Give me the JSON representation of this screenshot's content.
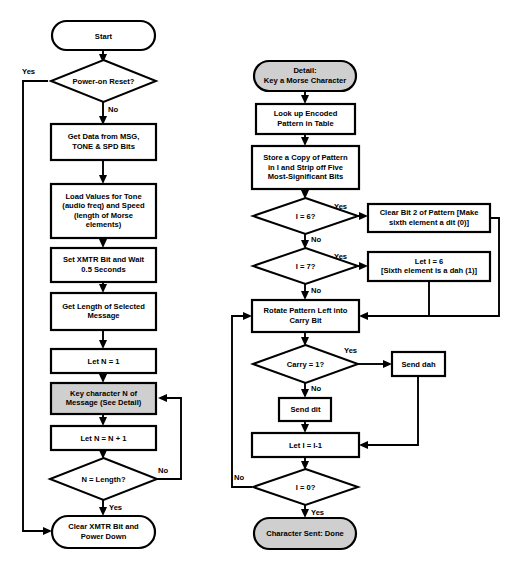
{
  "diagram": {
    "colors": {
      "line": "#000000",
      "node_fill": "#ffffff",
      "shaded_fill": "#cfcfcf",
      "background": "#ffffff"
    },
    "main_flow": {
      "nodes": [
        {
          "id": "start",
          "type": "terminal",
          "label": "Start"
        },
        {
          "id": "power_on_reset",
          "type": "decision",
          "label": "Power-on Reset?"
        },
        {
          "id": "get_data",
          "type": "process",
          "label": "Get Data from MSG,\nTONE & SPD Bits"
        },
        {
          "id": "load_values",
          "type": "process",
          "label": "Load Values for Tone\n(audio freq) and Speed\n(length of Morse\nelements)"
        },
        {
          "id": "set_xmtr",
          "type": "process",
          "label": "Set XMTR Bit and Wait\n0.5 Seconds"
        },
        {
          "id": "get_length",
          "type": "process",
          "label": "Get Length of Selected\nMessage"
        },
        {
          "id": "let_n_1",
          "type": "process",
          "label": "Let N = 1"
        },
        {
          "id": "key_char",
          "type": "process-shaded",
          "label": "Key character N of\nMessage (See Detail)"
        },
        {
          "id": "let_n_inc",
          "type": "process",
          "label": "Let N = N + 1"
        },
        {
          "id": "n_eq_length",
          "type": "decision",
          "label": "N = Length?"
        },
        {
          "id": "clear_xmtr",
          "type": "terminal",
          "label": "Clear XMTR Bit and\nPower Down"
        }
      ],
      "edge_labels": {
        "power_on_reset_yes": "Yes",
        "power_on_reset_no": "No",
        "n_eq_length_no": "No",
        "n_eq_length_yes": "Yes"
      }
    },
    "detail_flow": {
      "nodes": [
        {
          "id": "detail_start",
          "type": "terminal-shaded",
          "label": "Detail:\nKey a Morse Character"
        },
        {
          "id": "lookup",
          "type": "process",
          "label": "Look up Encoded\nPattern in Table"
        },
        {
          "id": "store_copy",
          "type": "process",
          "label": "Store a Copy of Pattern\nin I and Strip off Five\nMost-Significant Bits"
        },
        {
          "id": "i_eq_6",
          "type": "decision",
          "label": "I = 6?"
        },
        {
          "id": "clear_bit2",
          "type": "process",
          "label": "Clear Bit 2 of Pattern [Make\nsixth element a dit (0)]"
        },
        {
          "id": "i_eq_7",
          "type": "decision",
          "label": "I = 7?"
        },
        {
          "id": "let_i_6",
          "type": "process",
          "label": "Let I = 6\n[Sixth element is a dah (1)]"
        },
        {
          "id": "rotate_pattern",
          "type": "process",
          "label": "Rotate Pattern Left into\nCarry Bit"
        },
        {
          "id": "carry_eq_1",
          "type": "decision",
          "label": "Carry = 1?"
        },
        {
          "id": "send_dah",
          "type": "process",
          "label": "Send dah"
        },
        {
          "id": "send_dit",
          "type": "process",
          "label": "Send dit"
        },
        {
          "id": "let_i_dec",
          "type": "process",
          "label": "Let I = I-1"
        },
        {
          "id": "i_eq_0",
          "type": "decision",
          "label": "I = 0?"
        },
        {
          "id": "char_done",
          "type": "terminal-shaded",
          "label": "Character Sent: Done"
        }
      ],
      "edge_labels": {
        "i_eq_6_yes": "Yes",
        "i_eq_6_no": "No",
        "i_eq_7_yes": "Yes",
        "i_eq_7_no": "No",
        "carry_eq_1_yes": "Yes",
        "carry_eq_1_no": "No",
        "i_eq_0_no": "No",
        "i_eq_0_yes": "Yes"
      }
    }
  }
}
